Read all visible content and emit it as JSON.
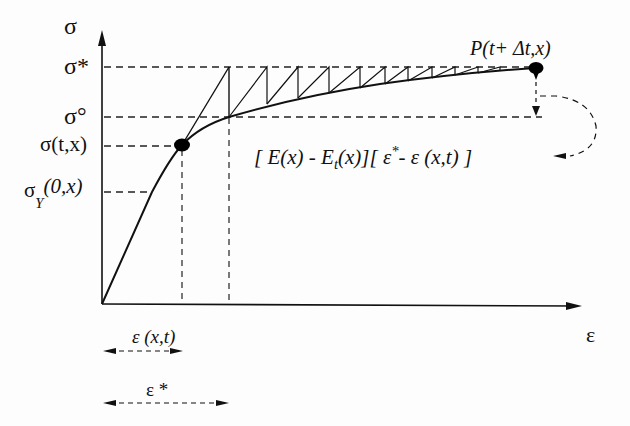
{
  "diagram": {
    "type": "stress-strain",
    "axes": {
      "y_label": "σ",
      "x_label": "ε"
    },
    "y_levels": [
      {
        "key": "sigma_star",
        "label": "σ*"
      },
      {
        "key": "sigma_o",
        "label": "σ°"
      },
      {
        "key": "sigma_tx",
        "label": "σ(t,x)"
      },
      {
        "key": "sigma_y0x",
        "label_main": "σ",
        "label_sub": "Y",
        "label_rest": "(0,x)"
      }
    ],
    "point_label": "P(t+ Δt,x)",
    "expression": {
      "part1": "[ E(x) - E",
      "part1_sub": "t",
      "part2": "(x)][ ε",
      "part2_sup": "*",
      "part3": "- ε (x,t) ]"
    },
    "strain_markers": [
      {
        "key": "eps_xt",
        "label": "ε (x,t)"
      },
      {
        "key": "eps_star",
        "label": "ε *"
      }
    ],
    "colors": {
      "ink": "#111111",
      "background": "#fdfdfd"
    }
  }
}
